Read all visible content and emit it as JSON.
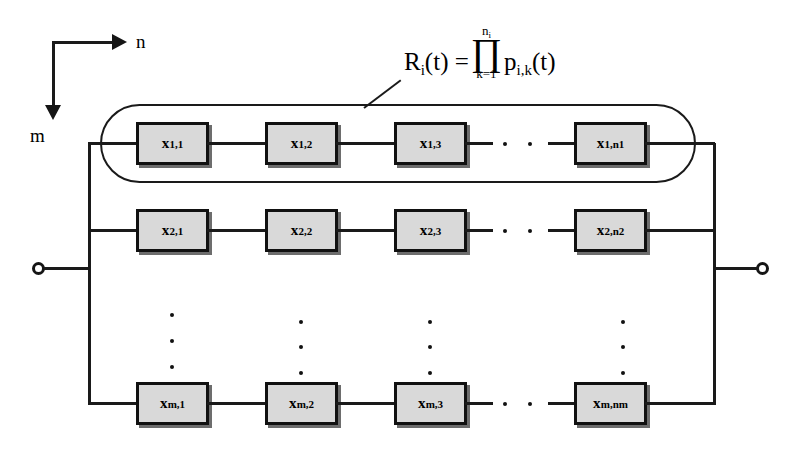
{
  "diagram": {
    "axes": {
      "horizontal_label": "n",
      "vertical_label": "m"
    },
    "formula": {
      "lhs": "R",
      "lhs_sub": "i",
      "lhs_arg": "(t) =",
      "product_upper": "n",
      "product_upper_sub": "i",
      "product_symbol": "∏",
      "product_lower": "k=1",
      "rhs": "p",
      "rhs_sub": "i,k",
      "rhs_arg": "(t)"
    },
    "ellipsis_dot": "·",
    "rows": [
      {
        "row_id": "row-1",
        "blocks": [
          {
            "base": "x",
            "sub": "1,1"
          },
          {
            "base": "x",
            "sub": "1,2"
          },
          {
            "base": "x",
            "sub": "1,3"
          },
          {
            "base": "x",
            "sub": "1,n1"
          }
        ]
      },
      {
        "row_id": "row-2",
        "blocks": [
          {
            "base": "x",
            "sub": "2,1"
          },
          {
            "base": "x",
            "sub": "2,2"
          },
          {
            "base": "x",
            "sub": "2,3"
          },
          {
            "base": "x",
            "sub": "2,n2"
          }
        ]
      },
      {
        "row_id": "row-m",
        "blocks": [
          {
            "base": "x",
            "sub": "m,1"
          },
          {
            "base": "x",
            "sub": "m,2"
          },
          {
            "base": "x",
            "sub": "m,3"
          },
          {
            "base": "x",
            "sub": "m,nm"
          }
        ]
      }
    ],
    "colors": {
      "block_fill": "#d9d9d9",
      "stroke": "#111111",
      "background": "#ffffff",
      "shadow": "#6d6d6d"
    }
  }
}
